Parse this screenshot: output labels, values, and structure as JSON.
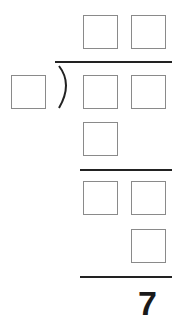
{
  "puzzle": {
    "type": "long-division",
    "quotient_boxes": 2,
    "dividend_boxes": 2,
    "divisor_boxes": 1,
    "first_product_boxes": 1,
    "second_row_boxes": 2,
    "second_product_boxes": 1,
    "remainder": "7"
  },
  "colors": {
    "box_border": "#8a8a8a",
    "line": "#222222",
    "digit": "#1a1a1a"
  }
}
